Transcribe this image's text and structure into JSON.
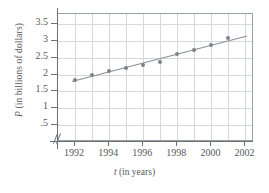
{
  "chart_data": {
    "type": "scatter",
    "title": "",
    "xlabel": "t (in years)",
    "ylabel": "P (in billions of dollars)",
    "xlabel_var": "t",
    "xlabel_rest": " (in years)",
    "ylabel_var": "P",
    "ylabel_rest": " (in billions of dollars)",
    "x": [
      1992,
      1993,
      1994,
      1995,
      1996,
      1997,
      1998,
      1999,
      2000,
      2001
    ],
    "values": [
      1.85,
      1.98,
      2.1,
      2.2,
      2.3,
      2.38,
      2.61,
      2.73,
      2.89,
      3.1
    ],
    "xticks": [
      1992,
      1994,
      1996,
      1998,
      2000,
      2002
    ],
    "xtick_labels": [
      "1992",
      "1994",
      "1996",
      "1998",
      "2000",
      "2002"
    ],
    "yticks": [
      0.5,
      1,
      1.5,
      2,
      2.5,
      3,
      3.5
    ],
    "ytick_labels": [
      ".5",
      "1",
      "1.5",
      "2",
      "2.5",
      "3",
      "3.5"
    ],
    "xlim": [
      1991,
      2002.5
    ],
    "ylim": [
      0,
      3.8
    ],
    "grid": true,
    "grid_x_step": 1,
    "grid_y_step": 0.5,
    "legend": "none",
    "axis_break": "//",
    "series": [
      {
        "name": "P data points",
        "values": [
          1.85,
          1.98,
          2.1,
          2.2,
          2.3,
          2.38,
          2.61,
          2.73,
          2.89,
          3.1
        ]
      },
      {
        "name": "trend line",
        "type": "line",
        "x_start": 1991.85,
        "y_start": 1.82,
        "x_end": 2002.1,
        "y_end": 3.17
      }
    ],
    "colors": {
      "marker": "#7d838a",
      "trend_line": "#8a9096",
      "grid": "#d6d9dc",
      "axis": "#6c7176",
      "text": "#55595d",
      "background": "#ffffff"
    }
  }
}
